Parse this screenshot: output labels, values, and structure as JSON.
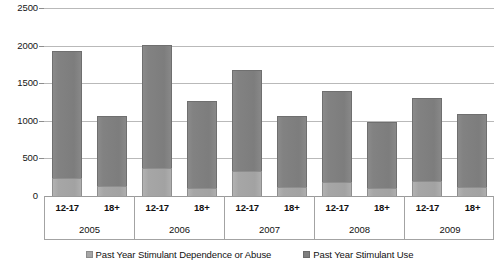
{
  "chart_data": {
    "type": "bar",
    "stacked": true,
    "title": "",
    "subtitle": "",
    "xlabel": "",
    "ylabel": "",
    "ylim": [
      0,
      2500
    ],
    "ytick_labels": [
      "0",
      "500",
      "1000",
      "1500",
      "2000",
      "2500"
    ],
    "ytick_values": [
      0,
      500,
      1000,
      1500,
      2000,
      2500
    ],
    "grid": true,
    "legend_position": "bottom",
    "groups": [
      "2005",
      "2006",
      "2007",
      "2008",
      "2009"
    ],
    "subcategories": [
      "12-17",
      "18+"
    ],
    "categories": [
      "2005 12-17",
      "2005 18+",
      "2006 12-17",
      "2006 18+",
      "2007 12-17",
      "2007 18+",
      "2008 12-17",
      "2008 18+",
      "2009 12-17",
      "2009 18+"
    ],
    "series": [
      {
        "name": "Past Year Stimulant Dependence or Abuse",
        "color": "#a6a6a6",
        "values": [
          240,
          130,
          370,
          110,
          330,
          120,
          190,
          100,
          200,
          120
        ]
      },
      {
        "name": "Past Year Stimulant Use",
        "color": "#7f7f7f",
        "values": [
          1930,
          1070,
          2010,
          1270,
          1680,
          1060,
          1400,
          980,
          1310,
          1090
        ]
      }
    ],
    "totals": [
      1930,
      1070,
      2010,
      1270,
      1680,
      1060,
      1400,
      980,
      1310,
      1090
    ]
  },
  "legend": {
    "items": [
      {
        "label": "Past Year Stimulant Dependence or Abuse",
        "swatch": "dep"
      },
      {
        "label": "Past Year Stimulant Use",
        "swatch": "use"
      }
    ]
  },
  "axis": {
    "groups": [
      {
        "label": "2005",
        "subticks": [
          "12-17",
          "18+"
        ]
      },
      {
        "label": "2006",
        "subticks": [
          "12-17",
          "18+"
        ]
      },
      {
        "label": "2007",
        "subticks": [
          "12-17",
          "18+"
        ]
      },
      {
        "label": "2008",
        "subticks": [
          "12-17",
          "18+"
        ]
      },
      {
        "label": "2009",
        "subticks": [
          "12-17",
          "18+"
        ]
      }
    ]
  }
}
